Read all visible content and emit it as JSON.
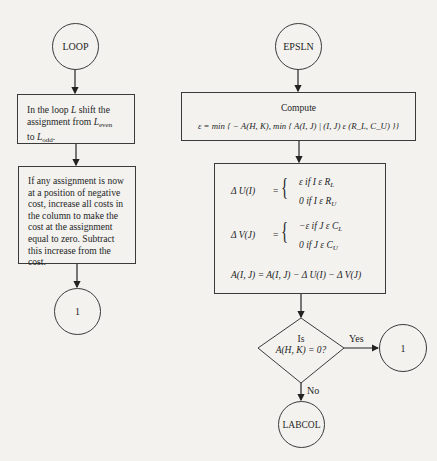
{
  "page": {
    "number_partial": "1??"
  },
  "left_column": {
    "start_connector": {
      "label": "LOOP"
    },
    "step1": {
      "line1": "In the loop ",
      "line1_var": "L",
      "line1_end": " shift the",
      "line2": "assignment from ",
      "line2_var": "L",
      "line2_sub": "even",
      "line3": "to ",
      "line3_var": "L",
      "line3_sub": "odd",
      "line3_end": "."
    },
    "step2": {
      "lines": [
        "If any assignment is now",
        "at a position of negative",
        "cost, increase all costs in",
        "the column to make the",
        "cost at the assignment",
        "equal to zero.  Subtract",
        "this increase from the",
        "cost."
      ]
    },
    "end_connector": {
      "label": "1"
    }
  },
  "right_column": {
    "start_connector": {
      "label": "EPSLN"
    },
    "compute_box": {
      "title": "Compute",
      "formula": "ε = min { − A(H, K), min { A(I, J) | (I, J) ε (R_L, C_U) }}"
    },
    "update_box": {
      "delta_u": {
        "lhs": "Δ U(I)",
        "eq": "=",
        "case1": "ε  if  I ε R",
        "case1_sub": "L",
        "case2": "0  if  I ε R",
        "case2_sub": "U"
      },
      "delta_v": {
        "lhs": "Δ V(J)",
        "eq": "=",
        "case1": "−ε  if  J ε C",
        "case1_sub": "L",
        "case2": "0  if  J ε C",
        "case2_sub": "U"
      },
      "update": "A(I, J) = A(I, J) − Δ U(I) − Δ V(J)"
    },
    "decision": {
      "line1": "Is",
      "line2": "A(H, K) = 0?",
      "yes_label": "Yes",
      "no_label": "No"
    },
    "yes_connector": {
      "label": "1"
    },
    "no_connector": {
      "label": "LABCOL"
    }
  }
}
